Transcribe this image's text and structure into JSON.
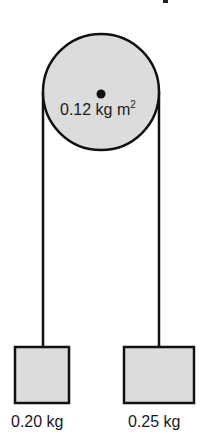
{
  "diagram": {
    "type": "atwood-machine",
    "pulley": {
      "moment_of_inertia_label": "0.12 kg m",
      "moment_of_inertia_exponent": "2",
      "fill": "#dcdcdc",
      "stroke": "#111111"
    },
    "masses": [
      {
        "label": "0.20 kg",
        "side": "left"
      },
      {
        "label": "0.25 kg",
        "side": "right"
      }
    ],
    "colors": {
      "block_fill": "#dcdcdc",
      "line": "#111111",
      "text": "#1a1a1a"
    }
  }
}
